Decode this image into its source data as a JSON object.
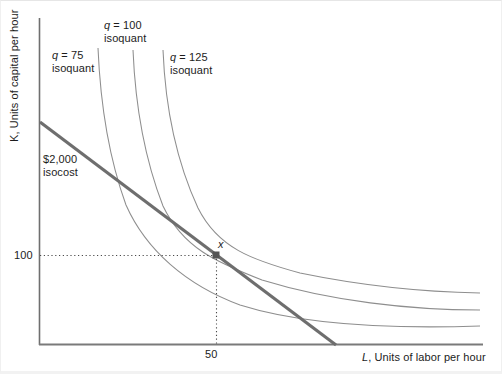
{
  "figure": {
    "type": "economics-isoquant-isocost-diagram",
    "background_color": "#ffffff",
    "axis_color": "#808080",
    "curve_color": "#808080",
    "isocost_color": "#6e6e6e",
    "text_color": "#1c1c1c",
    "width": 502,
    "height": 374
  },
  "axes": {
    "y_axis_label": "K, Units of capital per hour",
    "y_axis_label_italic_prefix": "K",
    "y_axis_label_rest": ", Units of capital per hour",
    "x_axis_label": "L, Units of labor per hour",
    "x_axis_label_italic_prefix": "L",
    "x_axis_label_rest": ", Units of labor per hour",
    "x_origin_px": 39,
    "y_baseline_px": 345,
    "x_extent_px": 483,
    "y_top_px": 18
  },
  "ticks": {
    "y": [
      {
        "label": "100",
        "value": 100,
        "y_px": 255
      }
    ],
    "x": [
      {
        "label": "50",
        "value": 50,
        "x_px": 216
      }
    ]
  },
  "annotations": {
    "optimum_point_label": "x",
    "optimum_point": {
      "L": 50,
      "K": 100,
      "x_px": 216,
      "y_px": 255
    }
  },
  "chart_data": {
    "type": "line",
    "title": "",
    "subtitle": "",
    "xlabel": "L, Units of labor per hour",
    "ylabel": "K, Units of capital per hour",
    "xlim": [
      0,
      0
    ],
    "ylim": [
      0,
      0
    ],
    "grid": false,
    "legend": "inline-curve-labels",
    "xticks": [
      "50"
    ],
    "yticks": [
      "100"
    ],
    "annotations": [
      {
        "text": "x",
        "kind": "tangency-point",
        "L": 50,
        "K": 100
      }
    ],
    "series": [
      {
        "name": "q = 75 isoquant",
        "label_line1": "q = 75",
        "label_line2": "isoquant",
        "label_q_italic": "q",
        "quantity": 75,
        "kind": "isoquant",
        "color": "#8a8a8a",
        "path_points_px": [
          [
            98,
            48
          ],
          [
            101,
            90
          ],
          [
            106,
            130
          ],
          [
            114,
            170
          ],
          [
            126,
            205
          ],
          [
            143,
            235
          ],
          [
            166,
            262
          ],
          [
            196,
            285
          ],
          [
            232,
            303
          ],
          [
            274,
            315
          ],
          [
            320,
            322
          ],
          [
            370,
            326
          ],
          [
            425,
            328
          ],
          [
            480,
            326
          ]
        ]
      },
      {
        "name": "q = 100 isoquant",
        "label_line1": "q = 100",
        "label_line2": "isoquant",
        "label_q_italic": "q",
        "quantity": 100,
        "kind": "isoquant",
        "color": "#8a8a8a",
        "path_points_px": [
          [
            133,
            50
          ],
          [
            136,
            92
          ],
          [
            141,
            132
          ],
          [
            150,
            172
          ],
          [
            163,
            206
          ],
          [
            181,
            234
          ],
          [
            205,
            252
          ],
          [
            232,
            268
          ],
          [
            268,
            283
          ],
          [
            310,
            295
          ],
          [
            355,
            303
          ],
          [
            400,
            308
          ],
          [
            443,
            310
          ],
          [
            480,
            310
          ]
        ]
      },
      {
        "name": "q = 125 isoquant",
        "label_line1": "q = 125",
        "label_line2": "isoquant",
        "label_q_italic": "q",
        "quantity": 125,
        "kind": "isoquant",
        "color": "#8a8a8a",
        "path_points_px": [
          [
            163,
            50
          ],
          [
            167,
            94
          ],
          [
            173,
            135
          ],
          [
            183,
            175
          ],
          [
            198,
            208
          ],
          [
            218,
            234
          ],
          [
            245,
            254
          ],
          [
            278,
            268
          ],
          [
            316,
            278
          ],
          [
            358,
            285
          ],
          [
            400,
            290
          ],
          [
            440,
            292
          ],
          [
            480,
            293
          ]
        ]
      },
      {
        "name": "$2,000 isocost",
        "label_line1": "$2,000",
        "label_line2": "isocost",
        "kind": "isocost",
        "cost": 2000,
        "cost_label": "$2,000",
        "color": "#6e6e6e",
        "endpoints_px": [
          [
            40,
            122
          ],
          [
            336,
            345
          ]
        ]
      }
    ]
  },
  "labels": {
    "q75_line1": "q = 75",
    "q75_line2": "isoquant",
    "q100_line1": "q = 100",
    "q100_line2": "isoquant",
    "q125_line1": "q = 125",
    "q125_line2": "isoquant",
    "isocost_line1": "$2,000",
    "isocost_line2": "isocost",
    "point_x": "x",
    "tick_y_100": "100",
    "tick_x_50": "50"
  }
}
